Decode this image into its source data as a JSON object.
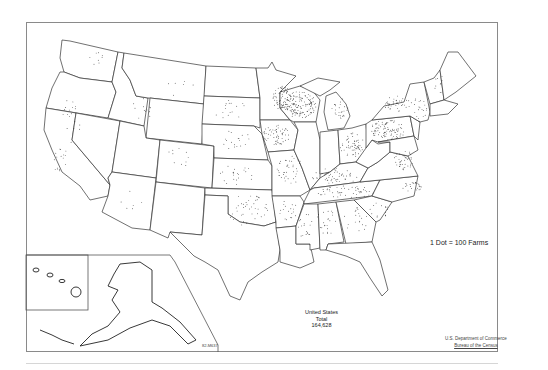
{
  "map": {
    "title": "Farms (dot density map), United States",
    "legend": {
      "label": "1 Dot = 100 Farms",
      "dot_value": 100,
      "unit": "Farms"
    },
    "total": {
      "line1": "United States",
      "line2": "Total",
      "value": "164,628"
    },
    "map_id": "82-M637",
    "credit": {
      "line1": "U.S. Department of Commerce",
      "line2": "Bureau of the Census"
    },
    "insets": [
      "Hawaii",
      "Alaska"
    ],
    "colors": {
      "outline": "#333333",
      "dot": "#1a1a1a",
      "frame": "#8a8a8a",
      "background": "#ffffff"
    },
    "dense_regions": [
      "Wisconsin",
      "Minnesota (south-east)",
      "Iowa",
      "Pennsylvania",
      "Ohio",
      "New York",
      "Kentucky",
      "Tennessee",
      "Chesapeake Bay / Virginia coast"
    ],
    "sparse_regions": [
      "Nevada",
      "Utah",
      "Wyoming",
      "Colorado",
      "Arizona",
      "New Mexico",
      "Montana",
      "Idaho"
    ]
  }
}
